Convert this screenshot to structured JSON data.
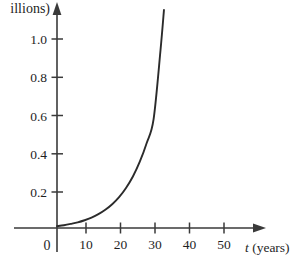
{
  "chart_data": {
    "type": "line",
    "title": "",
    "subtitle": "",
    "xlabel": "t (years)",
    "xlabel_variable": "t",
    "xlabel_unit": "(years)",
    "ylabel": "(millions)",
    "ylabel_visible_text": "illions)",
    "ylabel_note": "left-cropped at image edge",
    "origin_label": "0",
    "grid": false,
    "legend": "none",
    "xlim": [
      0,
      57
    ],
    "ylim": [
      0,
      1.22
    ],
    "xticks": [
      10,
      20,
      30,
      40,
      50
    ],
    "xtick_labels": [
      "10",
      "20",
      "30",
      "40",
      "50"
    ],
    "yticks": [
      0.2,
      0.4,
      0.6,
      0.8,
      1.0
    ],
    "ytick_labels": [
      "0.2",
      "0.4",
      "0.6",
      "0.8",
      "1.0"
    ],
    "series": [
      {
        "name": "population",
        "curve_type": "exponential-growth",
        "x": [
          0,
          2,
          4,
          6,
          8,
          10,
          12,
          14,
          16,
          18,
          20,
          22,
          24,
          26,
          28,
          30,
          31
        ],
        "y": [
          0.02,
          0.025,
          0.032,
          0.04,
          0.051,
          0.065,
          0.083,
          0.106,
          0.135,
          0.172,
          0.22,
          0.28,
          0.357,
          0.455,
          0.58,
          0.94,
          1.15
        ]
      }
    ],
    "colors": {
      "curve": "#2b2b2b",
      "axis": "#3a3a3a",
      "text": "#1f1f1f",
      "background": "#ffffff"
    }
  }
}
